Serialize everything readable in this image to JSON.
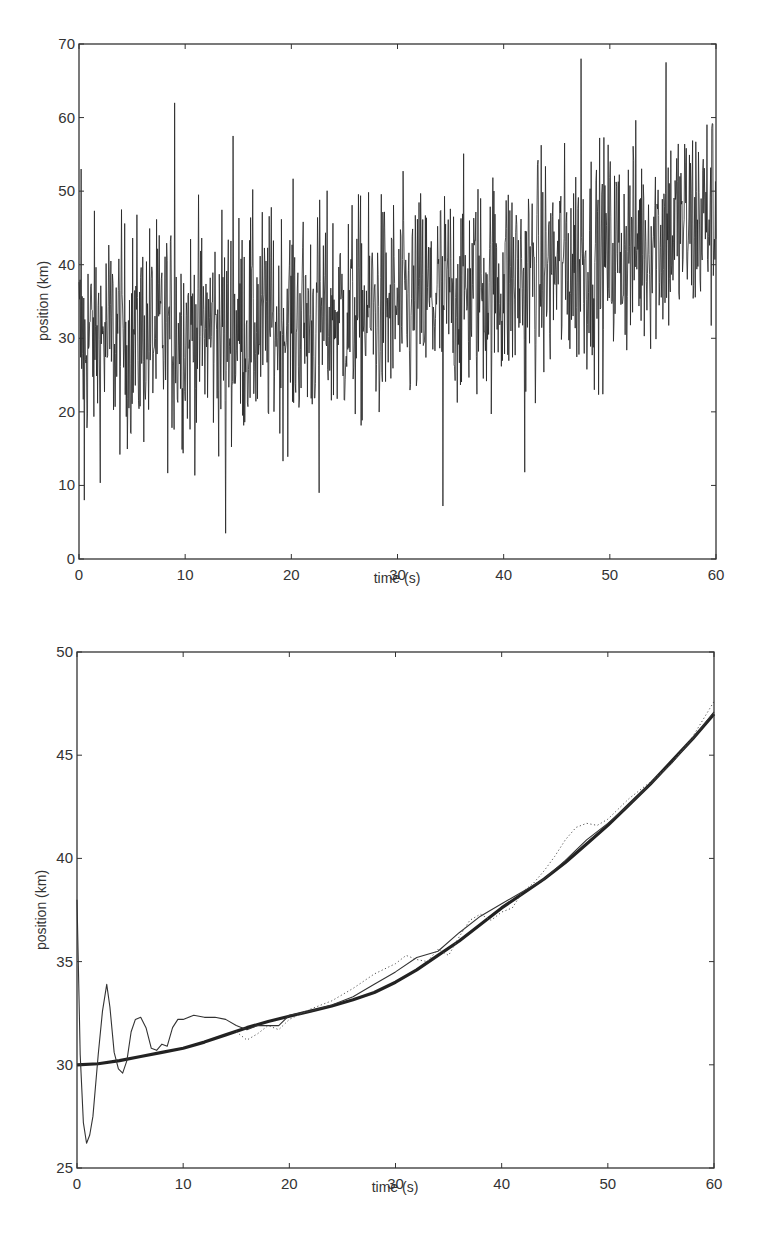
{
  "chart_data": [
    {
      "id": "top",
      "type": "line",
      "title": "",
      "xlabel": "time (s)",
      "ylabel": "position (km)",
      "xlim": [
        0,
        60
      ],
      "ylim": [
        0,
        70
      ],
      "xticks": [
        0,
        10,
        20,
        30,
        40,
        50,
        60
      ],
      "yticks": [
        0,
        10,
        20,
        30,
        40,
        50,
        60,
        70
      ],
      "grid": false,
      "legend": null,
      "frame": {
        "left": 79,
        "right": 716,
        "top": 44,
        "bottom": 559
      },
      "series": [
        {
          "name": "noisy position measurements",
          "style": "thin-solid",
          "color": "#222222",
          "description": "Dense noisy samples around a slowly increasing trend (about 30 km at t=0 to about 47 km at t=60), noise amplitude roughly +/-15 km with spikes",
          "samples": 1200,
          "noise_std": 7.5,
          "trend_x": [
            0,
            10,
            20,
            30,
            40,
            50,
            60
          ],
          "trend_y": [
            30,
            30.8,
            32.3,
            34.0,
            37.6,
            41.5,
            47.0
          ],
          "notable_points": [
            {
              "x": 0.2,
              "y": 53
            },
            {
              "x": 0.5,
              "y": 8
            },
            {
              "x": 9.0,
              "y": 62
            },
            {
              "x": 13.8,
              "y": 3.5
            },
            {
              "x": 14.5,
              "y": 57.5
            },
            {
              "x": 22.6,
              "y": 9
            },
            {
              "x": 34.3,
              "y": 7.2
            },
            {
              "x": 47.3,
              "y": 68
            },
            {
              "x": 55.3,
              "y": 67.5
            },
            {
              "x": 42.0,
              "y": 11.8
            }
          ]
        }
      ]
    },
    {
      "id": "bottom",
      "type": "line",
      "title": "",
      "xlabel": "time (s)",
      "ylabel": "position (km)",
      "xlim": [
        0,
        60
      ],
      "ylim": [
        25,
        50
      ],
      "xticks": [
        0,
        10,
        20,
        30,
        40,
        50,
        60
      ],
      "yticks": [
        25,
        30,
        35,
        40,
        45,
        50
      ],
      "grid": false,
      "legend": null,
      "frame": {
        "left": 77,
        "right": 714,
        "top": 652,
        "bottom": 1168
      },
      "series": [
        {
          "name": "true position",
          "style": "thick-solid",
          "color": "#222222",
          "x": [
            0,
            2,
            4,
            6,
            8,
            10,
            12,
            14,
            16,
            18,
            20,
            22,
            24,
            26,
            28,
            30,
            32,
            34,
            36,
            38,
            40,
            42,
            44,
            46,
            48,
            50,
            52,
            54,
            56,
            58,
            60
          ],
          "y": [
            30.0,
            30.05,
            30.2,
            30.4,
            30.6,
            30.8,
            31.1,
            31.45,
            31.8,
            32.1,
            32.35,
            32.6,
            32.85,
            33.15,
            33.5,
            34.0,
            34.6,
            35.3,
            36.0,
            36.8,
            37.6,
            38.3,
            39.0,
            39.8,
            40.7,
            41.6,
            42.6,
            43.6,
            44.7,
            45.8,
            47.0
          ]
        },
        {
          "name": "filter estimate",
          "style": "thin-solid",
          "color": "#333333",
          "x": [
            0,
            0.3,
            0.6,
            0.9,
            1.2,
            1.5,
            2.0,
            2.4,
            2.8,
            3.1,
            3.5,
            3.9,
            4.3,
            4.7,
            5.1,
            5.5,
            6.0,
            6.5,
            7.0,
            7.5,
            8.0,
            8.5,
            9.0,
            9.5,
            10.0,
            11.0,
            12.0,
            13.0,
            14.0,
            15.0,
            16.0,
            17.0,
            18.0,
            19.0,
            20.0,
            22.0,
            24.0,
            26.0,
            28.0,
            30.0,
            32.0,
            34.0,
            36.0,
            38.0,
            40.0,
            42.0,
            44.0,
            46.0,
            48.0,
            50.0,
            52.0,
            54.0,
            56.0,
            58.0,
            60.0
          ],
          "y": [
            38.0,
            30.5,
            27.2,
            26.2,
            26.6,
            27.5,
            30.5,
            32.6,
            33.9,
            32.8,
            30.6,
            29.8,
            29.6,
            30.2,
            31.6,
            32.2,
            32.3,
            31.8,
            30.8,
            30.7,
            31.0,
            30.9,
            31.8,
            32.2,
            32.2,
            32.4,
            32.3,
            32.3,
            32.2,
            31.9,
            31.7,
            31.9,
            31.9,
            31.9,
            32.4,
            32.6,
            32.9,
            33.3,
            33.9,
            34.5,
            35.2,
            35.5,
            36.4,
            37.2,
            37.8,
            38.4,
            39.0,
            39.9,
            40.9,
            41.7,
            42.6,
            43.6,
            44.6,
            45.8,
            47.1
          ]
        },
        {
          "name": "smoothed estimate",
          "style": "dotted",
          "color": "#555555",
          "x": [
            15,
            16,
            17,
            18,
            19,
            20,
            22,
            24,
            26,
            28,
            30,
            31,
            32,
            33,
            34,
            35,
            36,
            37,
            38,
            39,
            40,
            41,
            42,
            43,
            44,
            45,
            46,
            47,
            48,
            49,
            50,
            52,
            54,
            56,
            58,
            60
          ],
          "y": [
            31.6,
            31.2,
            31.5,
            31.9,
            31.7,
            32.2,
            32.7,
            33.1,
            33.7,
            34.4,
            34.9,
            35.3,
            35.1,
            35.0,
            35.6,
            35.3,
            36.2,
            37.0,
            37.3,
            37.0,
            37.4,
            37.6,
            38.4,
            38.8,
            39.4,
            40.1,
            40.9,
            41.5,
            41.7,
            41.6,
            41.9,
            42.9,
            43.7,
            44.6,
            45.9,
            47.6
          ]
        }
      ]
    }
  ],
  "top_plot": {
    "xlabel": "time (s)",
    "ylabel": "position (km)",
    "xtick_labels": [
      "0",
      "10",
      "20",
      "30",
      "40",
      "50",
      "60"
    ],
    "ytick_labels": [
      "0",
      "10",
      "20",
      "30",
      "40",
      "50",
      "60",
      "70"
    ]
  },
  "bottom_plot": {
    "xlabel": "time (s)",
    "ylabel": "position (km)",
    "xtick_labels": [
      "0",
      "10",
      "20",
      "30",
      "40",
      "50",
      "60"
    ],
    "ytick_labels": [
      "25",
      "30",
      "35",
      "40",
      "45",
      "50"
    ]
  }
}
